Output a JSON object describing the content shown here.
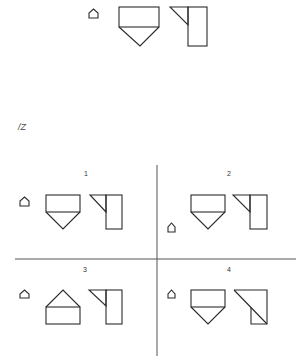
{
  "figure": {
    "problem_label": "/Z",
    "stroke_color": "#2a2a2a",
    "background": "#ffffff",
    "stimulus": {
      "icon": "small-house-icon",
      "shape_a": "rectangle-with-downward-triangle",
      "shape_b": "triangle-left-of-tall-rectangle"
    },
    "options": [
      {
        "number": "1",
        "icon_position": "left-middle",
        "shape_a": "rectangle-with-downward-triangle",
        "shape_b": "triangle-left-of-tall-rectangle"
      },
      {
        "number": "2",
        "icon_position": "left-bottom",
        "shape_a": "rectangle-with-downward-triangle",
        "shape_b": "triangle-left-of-tall-rectangle"
      },
      {
        "number": "3",
        "icon_position": "left-middle",
        "shape_a": "rectangle-with-upward-triangle",
        "shape_b": "triangle-left-of-tall-rectangle"
      },
      {
        "number": "4",
        "icon_position": "left-middle",
        "shape_a": "rectangle-with-downward-triangle",
        "shape_b": "square-with-diagonal"
      }
    ]
  }
}
